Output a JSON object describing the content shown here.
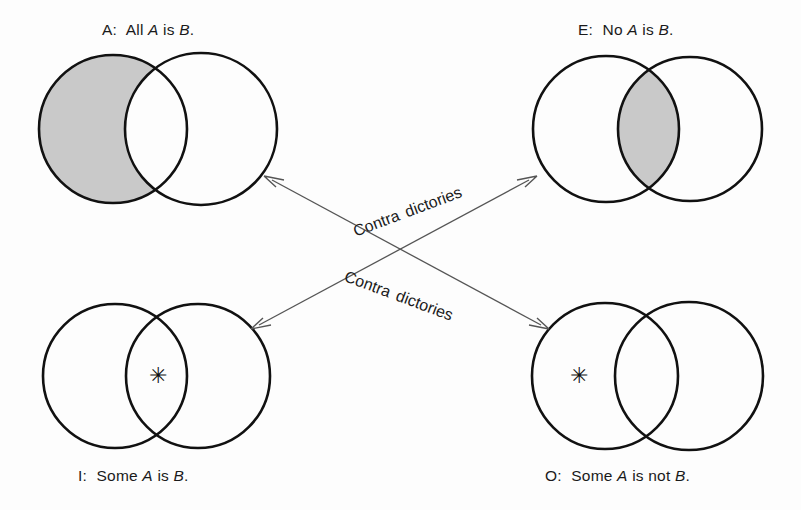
{
  "figure": {
    "title_text": "Square of opposition Venn diagrams",
    "background_color": "#fdfdfd",
    "stroke_color": "#111111",
    "shade_color": "#c9c9c9",
    "arrow_color": "#555555"
  },
  "diagrams": {
    "a": {
      "key": "A",
      "prefix": "A:",
      "caption_plain": "A:  All A is B.",
      "word1": "All",
      "term1": "A",
      "copula": "is",
      "term2": "B",
      "period": ".",
      "shaded_region": "left-only",
      "star": null
    },
    "e": {
      "key": "E",
      "prefix": "E:",
      "caption_plain": "E:  No A is B.",
      "word1": "No",
      "term1": "A",
      "copula": "is",
      "term2": "B",
      "period": ".",
      "shaded_region": "intersection",
      "star": null
    },
    "i": {
      "key": "I",
      "prefix": "I:",
      "caption_plain": "I:  Some A is B.",
      "word1": "Some",
      "term1": "A",
      "copula": "is",
      "term2": "B",
      "period": ".",
      "shaded_region": "none",
      "star": "✳"
    },
    "o": {
      "key": "O",
      "prefix": "O:",
      "caption_plain": "O:  Some A is not B.",
      "word1": "Some",
      "term1": "A",
      "copula": "is not",
      "term2": "B",
      "period": ".",
      "shaded_region": "none",
      "star": "✳"
    }
  },
  "relations": [
    {
      "id": "upper",
      "word1": "Contra",
      "word2": "dictories",
      "from": "A",
      "to": "E",
      "double_headed": true
    },
    {
      "id": "lower",
      "word1": "Contra",
      "word2": "dictories",
      "from": "I",
      "to": "O",
      "double_headed": true
    }
  ]
}
